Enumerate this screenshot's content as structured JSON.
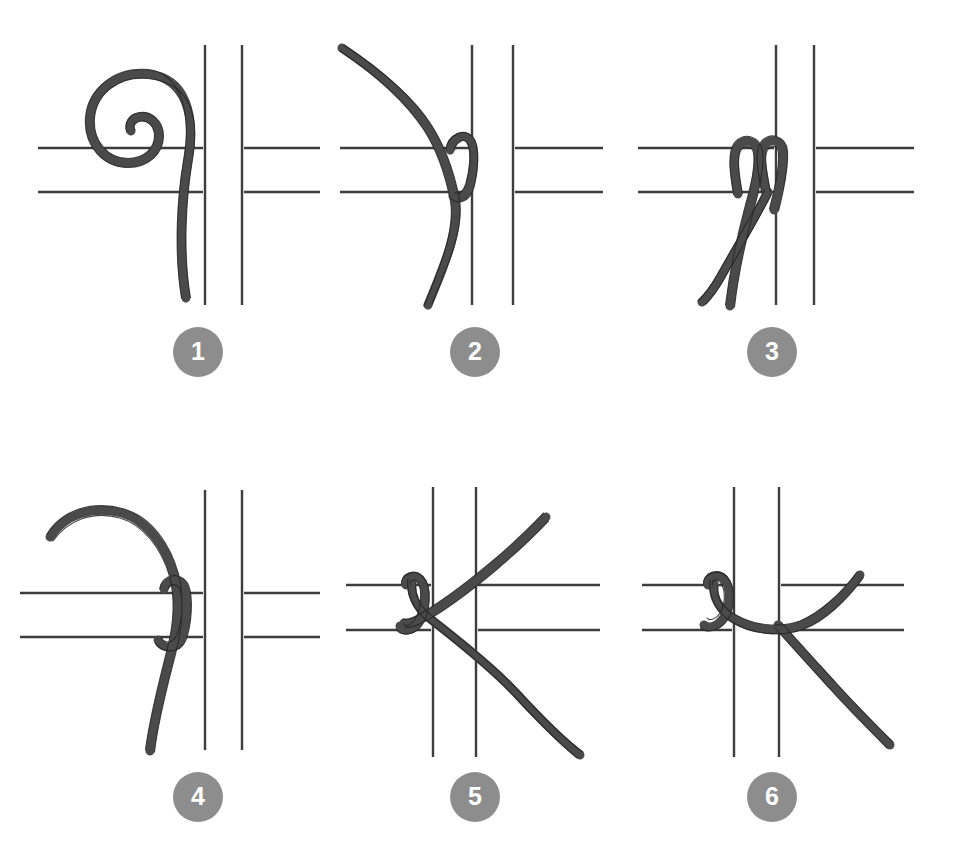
{
  "figure": {
    "background_color": "#ffffff",
    "panel_count": 6,
    "columns": 3,
    "rows": 2,
    "cord_color": "#4a4a4a",
    "cord_outline_color": "#2b2b2b",
    "grid_line_color": "#3d3d3d",
    "badge_color": "#8d8d8d",
    "badge_text_color": "#ffffff"
  },
  "steps": [
    {
      "number": "1",
      "name": "step-1-coiled-cord-beside-grid",
      "description": "A coiled cord hangs to the left of the vertical grid bars, its tail running down past both horizontal bars.",
      "badge_x": 178,
      "badge_y": 352
    },
    {
      "number": "2",
      "name": "step-2-cord-wrapped-around-bar",
      "description": "The cord is brought over and around the left vertical bar, forming a first loop between the two horizontal bars.",
      "badge_x": 475,
      "badge_y": 352
    },
    {
      "number": "3",
      "name": "step-3-two-tails-pulled-down",
      "description": "Both cord ends hang down on the left side of the vertical bar after the wrap is pulled snug.",
      "badge_x": 772,
      "badge_y": 352
    },
    {
      "number": "4",
      "name": "step-4-loop-tightened-into-hitch",
      "description": "The loop is tightened into a lark's head hitch around the vertical bar, with the free end arcing up and to the left.",
      "badge_x": 178,
      "badge_y": 797
    },
    {
      "number": "5",
      "name": "step-5-cord-crossed-to-the-right",
      "description": "The knot sits at the bar intersection and the cord ends are drawn out to the right, crossing each other.",
      "badge_x": 475,
      "badge_y": 797
    },
    {
      "number": "6",
      "name": "step-6-finished-knot",
      "description": "The finished knot is cinched at the intersection, the working end running off to the upper right and the tail down to the lower right.",
      "badge_x": 772,
      "badge_y": 797
    }
  ],
  "panels": [
    {
      "left": 20,
      "top": 20
    },
    {
      "left": 318,
      "top": 20
    },
    {
      "left": 616,
      "top": 20
    },
    {
      "left": 20,
      "top": 465
    },
    {
      "left": 318,
      "top": 465
    },
    {
      "left": 616,
      "top": 465
    }
  ]
}
